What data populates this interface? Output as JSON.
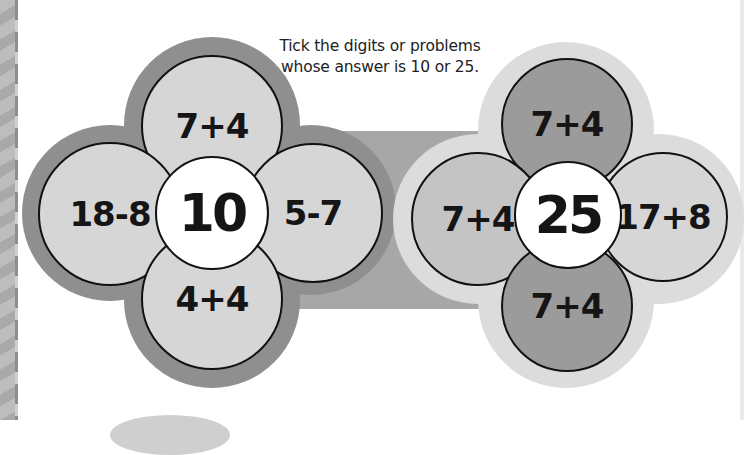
{
  "instruction": {
    "line1": "Tick the digits or problems",
    "line2": "whose answer is 10 or 25."
  },
  "flowers": [
    {
      "target": "10",
      "petals": {
        "top": "7+4",
        "left": "18-8",
        "right": "5-7",
        "bottom": "4+4"
      }
    },
    {
      "target": "25",
      "petals": {
        "top": "7+4",
        "left": "7+4",
        "right": "17+8",
        "bottom": "7+4"
      }
    }
  ],
  "colors": {
    "halo_left": "#8f8f8f",
    "halo_right": "#dcdcdc",
    "band": "#a7a7a7",
    "petal_pale": "#d6d6d6",
    "petal_dark": "#9b9b9b",
    "center": "#ffffff"
  }
}
